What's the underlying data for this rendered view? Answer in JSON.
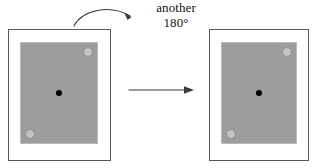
{
  "diagram": {
    "type": "geometric-transformation",
    "title": "",
    "caption": {
      "line1": "another",
      "line2": "180°"
    },
    "colors": {
      "background": "#ffffff",
      "card_fill": "#ffffff",
      "card_border": "#58585a",
      "plate_fill": "#9d9d9d",
      "plate_border": "#b9b9b9",
      "hole_fill": "#c3c3c3",
      "hole_border": "#8f8f8f",
      "center_dot": "#000000",
      "arrow": "#3a3a3a",
      "text": "#111111"
    },
    "figures": [
      {
        "id": "before",
        "label": "",
        "plate": {
          "fill": "#9d9d9d",
          "holes": [
            {
              "position": "top-right"
            },
            {
              "position": "bottom-left"
            }
          ],
          "center_marker": "center-dot"
        }
      },
      {
        "id": "after",
        "label": "",
        "plate": {
          "fill": "#9d9d9d",
          "holes": [
            {
              "position": "top-right"
            },
            {
              "position": "bottom-left"
            }
          ],
          "center_marker": "center-dot"
        }
      }
    ],
    "connectors": [
      {
        "id": "transform-arrow",
        "kind": "straight",
        "direction": "right",
        "label": ""
      },
      {
        "id": "rotation-arrow",
        "kind": "curved",
        "direction": "clockwise-right",
        "label": "another 180°"
      }
    ]
  }
}
